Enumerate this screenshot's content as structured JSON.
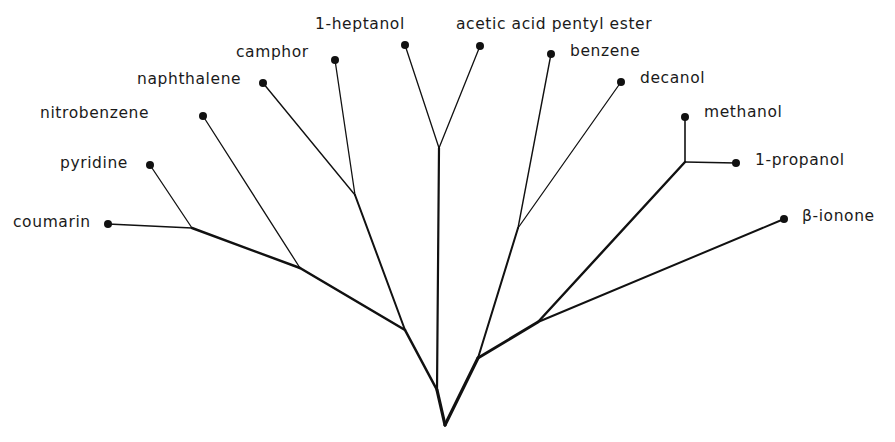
{
  "diagram": {
    "type": "tree",
    "title": "",
    "colors": {
      "line": "#111111",
      "text": "#1a1a1a",
      "background": "#ffffff"
    },
    "nodes": [
      {
        "id": "root",
        "x": 445,
        "y": 425
      },
      {
        "id": "jL1",
        "x": 437,
        "y": 390
      },
      {
        "id": "jL2",
        "x": 405,
        "y": 330
      },
      {
        "id": "jL3",
        "x": 300,
        "y": 268
      },
      {
        "id": "jL4",
        "x": 192,
        "y": 228
      },
      {
        "id": "jCam",
        "x": 355,
        "y": 195
      },
      {
        "id": "jHep",
        "x": 439,
        "y": 148
      },
      {
        "id": "jR1",
        "x": 478,
        "y": 358
      },
      {
        "id": "jR2",
        "x": 538,
        "y": 322
      },
      {
        "id": "jBen",
        "x": 518,
        "y": 228
      },
      {
        "id": "jMet",
        "x": 685,
        "y": 162
      }
    ],
    "leaves": [
      {
        "name": "coumarin",
        "x": 108,
        "y": 224,
        "label_x": 13,
        "label_y": 215
      },
      {
        "name": "pyridine",
        "x": 150,
        "y": 165,
        "label_x": 60,
        "label_y": 156
      },
      {
        "name": "nitrobenzene",
        "x": 203,
        "y": 116,
        "label_x": 40,
        "label_y": 106
      },
      {
        "name": "naphthalene",
        "x": 263,
        "y": 83,
        "label_x": 137,
        "label_y": 72
      },
      {
        "name": "camphor",
        "x": 335,
        "y": 60,
        "label_x": 236,
        "label_y": 45
      },
      {
        "name": "1-heptanol",
        "x": 405,
        "y": 45,
        "label_x": 315,
        "label_y": 17
      },
      {
        "name": "acetic acid pentyl ester",
        "x": 480,
        "y": 46,
        "label_x": 456,
        "label_y": 17
      },
      {
        "name": "benzene",
        "x": 551,
        "y": 54,
        "label_x": 570,
        "label_y": 44
      },
      {
        "name": "decanol",
        "x": 621,
        "y": 82,
        "label_x": 640,
        "label_y": 71
      },
      {
        "name": "methanol",
        "x": 685,
        "y": 117,
        "label_x": 704,
        "label_y": 105
      },
      {
        "name": "1-propanol",
        "x": 736,
        "y": 163,
        "label_x": 755,
        "label_y": 153
      },
      {
        "name": "β-ionone",
        "x": 784,
        "y": 219,
        "label_x": 802,
        "label_y": 209
      }
    ],
    "edges": [
      {
        "from": "root",
        "to": "jL1",
        "weight": 3.2
      },
      {
        "from": "jL1",
        "to": "jL2",
        "weight": 2.6
      },
      {
        "from": "jL2",
        "to": "jL3",
        "weight": 2.6
      },
      {
        "from": "jL3",
        "to": "jL4",
        "weight": 2.4
      },
      {
        "from": "jL4",
        "to": "coumarin",
        "weight": 1.6
      },
      {
        "from": "jL4",
        "to": "pyridine",
        "weight": 1.3
      },
      {
        "from": "jL3",
        "to": "nitrobenzene",
        "weight": 1.3
      },
      {
        "from": "jL2",
        "to": "jCam",
        "weight": 2.0
      },
      {
        "from": "jCam",
        "to": "naphthalene",
        "weight": 1.4
      },
      {
        "from": "jCam",
        "to": "camphor",
        "weight": 1.3
      },
      {
        "from": "jL1",
        "to": "jHep",
        "weight": 2.2
      },
      {
        "from": "jHep",
        "to": "1-heptanol",
        "weight": 1.3
      },
      {
        "from": "jHep",
        "to": "acetic acid pentyl ester",
        "weight": 1.3
      },
      {
        "from": "root",
        "to": "jR1",
        "weight": 3.2
      },
      {
        "from": "jR1",
        "to": "jBen",
        "weight": 2.0
      },
      {
        "from": "jBen",
        "to": "benzene",
        "weight": 1.4
      },
      {
        "from": "jBen",
        "to": "decanol",
        "weight": 1.3
      },
      {
        "from": "jR1",
        "to": "jR2",
        "weight": 2.8
      },
      {
        "from": "jR2",
        "to": "jMet",
        "weight": 2.4
      },
      {
        "from": "jMet",
        "to": "methanol",
        "weight": 1.6
      },
      {
        "from": "jMet",
        "to": "1-propanol",
        "weight": 1.6
      },
      {
        "from": "jR2",
        "to": "β-ionone",
        "weight": 2.0
      }
    ]
  }
}
